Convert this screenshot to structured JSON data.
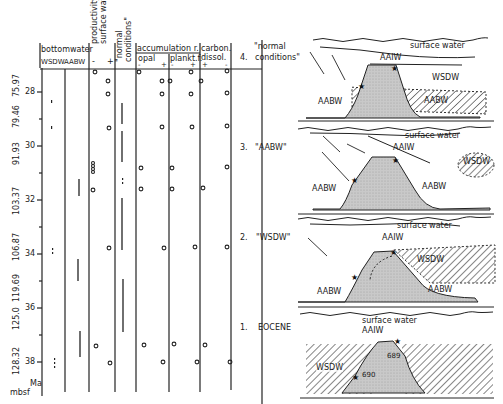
{
  "axis": {
    "age_label": "Ma",
    "depth_label": "mbsf",
    "age_ticks": [
      "28",
      "30",
      "32",
      "34",
      "36",
      "38"
    ],
    "depth_labels": [
      "79.46",
      "75.97",
      "91.93",
      "103.37",
      "106.87",
      "119.69",
      "125.0",
      "128.32"
    ]
  },
  "table": {
    "bottomwater": {
      "title": "bottomwater",
      "sub": [
        "WSDW",
        "AABW"
      ]
    },
    "productivity": {
      "title": "productivity",
      "title2": "surface wat.",
      "signs": [
        "-",
        "+"
      ]
    },
    "normal": {
      "title": "\"normal",
      "title2": "conditions\""
    },
    "accumulation": {
      "title": "accumulation r.",
      "opal": "opal",
      "plankt": "plankt.f.",
      "signs_opal": [
        "-",
        "+"
      ],
      "signs_plankt": [
        "-",
        "+"
      ]
    },
    "carbon": {
      "title": "carbon.",
      "title2": "dissol.",
      "signs": [
        "+",
        "-"
      ]
    }
  },
  "panels": [
    {
      "number": "4.",
      "name": "\"normal",
      "name2": "conditions\"",
      "labels": {
        "surface": "surface water",
        "intermediate": "AAIW",
        "wsdw": "WSDW",
        "aabw_left": "AABW",
        "aabw_right": "AABW"
      }
    },
    {
      "number": "3.",
      "name": "\"AABW\"",
      "labels": {
        "surface": "surface water",
        "intermediate": "AAIW",
        "wsdw": "WSDW",
        "aabw_left": "AABW",
        "aabw_right": "AABW"
      }
    },
    {
      "number": "2.",
      "name": "\"WSDW\"",
      "labels": {
        "surface": "surface water",
        "intermediate": "AAIW",
        "wsdw": "WSDW",
        "aabw_left": "AABW",
        "aabw_right": "AABW"
      }
    },
    {
      "number": "1.",
      "name": "EOCENE",
      "labels": {
        "surface": "surface water",
        "intermediate": "AAIW",
        "wsdw": "WSDW",
        "site_top": "689",
        "site_flank": "690"
      }
    }
  ]
}
